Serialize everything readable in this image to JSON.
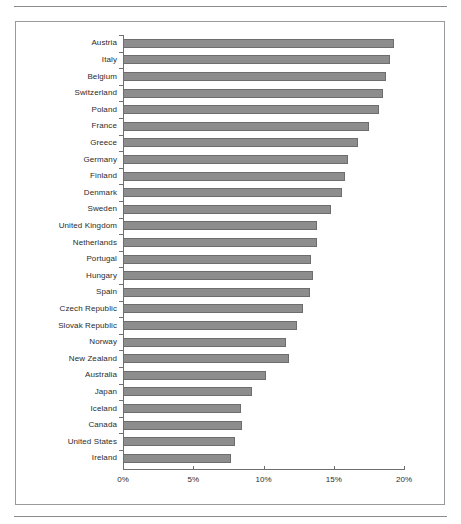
{
  "figure": {
    "rules": [
      "top-rule",
      "bottom-rule"
    ],
    "frame_color": "#9a9a9a",
    "bar_fill": "#8d8d8d",
    "bar_border": "#6d6d6d"
  },
  "chart_data": {
    "type": "bar",
    "orientation": "horizontal",
    "title": "",
    "subtitle": "",
    "xlabel": "",
    "ylabel": "",
    "xlim": [
      0,
      20
    ],
    "xticks": [
      0,
      5,
      10,
      15,
      20
    ],
    "xticklabels": [
      "0%",
      "5%",
      "10%",
      "15%",
      "20%"
    ],
    "grid": false,
    "legend": null,
    "value_suffix": "%",
    "categories": [
      "Austria",
      "Italy",
      "Belgium",
      "Switzerland",
      "Poland",
      "France",
      "Greece",
      "Germany",
      "Finland",
      "Denmark",
      "Sweden",
      "United Kingdom",
      "Netherlands",
      "Portugal",
      "Hungary",
      "Spain",
      "Czech Republic",
      "Slovak Republic",
      "Norway",
      "New Zealand",
      "Australia",
      "Japan",
      "Iceland",
      "Canada",
      "United States",
      "Ireland"
    ],
    "values": [
      19.3,
      19.0,
      18.7,
      18.5,
      18.2,
      17.5,
      16.7,
      16.0,
      15.8,
      15.6,
      14.8,
      13.8,
      13.8,
      13.4,
      13.5,
      13.3,
      12.8,
      12.4,
      11.6,
      11.8,
      10.2,
      9.2,
      8.4,
      8.5,
      8.0,
      7.7
    ]
  }
}
